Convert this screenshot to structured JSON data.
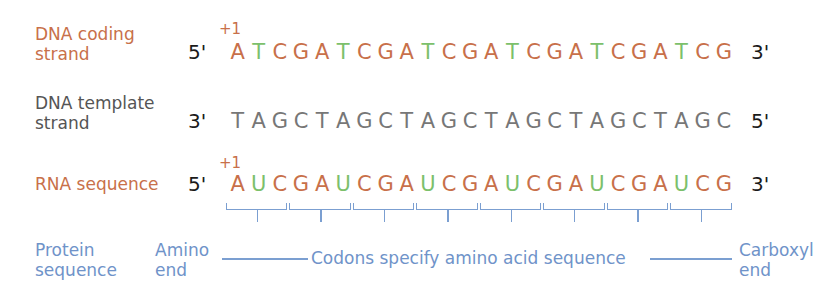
{
  "rows": {
    "coding": {
      "label_line1": "DNA coding",
      "label_line2": "strand",
      "start_marker": "+1",
      "left_end": "5'",
      "right_end": "3'",
      "bases": [
        "A",
        "T",
        "C",
        "G",
        "A",
        "T",
        "C",
        "G",
        "A",
        "T",
        "C",
        "G",
        "A",
        "T",
        "C",
        "G",
        "A",
        "T",
        "C",
        "G",
        "A",
        "T",
        "C",
        "G"
      ]
    },
    "template": {
      "label_line1": "DNA template",
      "label_line2": "strand",
      "left_end": "3'",
      "right_end": "5'",
      "bases": [
        "T",
        "A",
        "G",
        "C",
        "T",
        "A",
        "G",
        "C",
        "T",
        "A",
        "G",
        "C",
        "T",
        "A",
        "G",
        "C",
        "T",
        "A",
        "G",
        "C",
        "T",
        "A",
        "G",
        "C"
      ]
    },
    "rna": {
      "label": "RNA sequence",
      "start_marker": "+1",
      "left_end": "5'",
      "right_end": "3'",
      "bases": [
        "A",
        "U",
        "C",
        "G",
        "A",
        "U",
        "C",
        "G",
        "A",
        "U",
        "C",
        "G",
        "A",
        "U",
        "C",
        "G",
        "A",
        "U",
        "C",
        "G",
        "A",
        "U",
        "C",
        "G"
      ],
      "codons": [
        "AUC",
        "GAU",
        "CGA",
        "UCG",
        "AUC",
        "GAU",
        "CGA",
        "UCG"
      ]
    },
    "protein": {
      "label_line1": "Protein",
      "label_line2": "sequence",
      "amino_line1": "Amino",
      "amino_line2": "end",
      "middle": "Codons specify amino acid sequence",
      "carboxyl_line1": "Carboxyl",
      "carboxyl_line2": "end"
    }
  },
  "colors": {
    "purine_and_C": "#c8704a",
    "T_and_U": "#7cc06b",
    "template": "#777777",
    "protein_blue": "#6f93c9",
    "ends": "#1a1a1a"
  }
}
